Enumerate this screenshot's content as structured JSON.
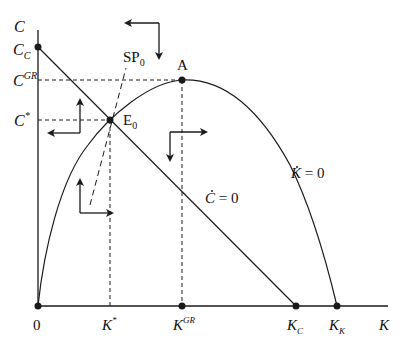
{
  "diagram": {
    "type": "phase-diagram",
    "colors": {
      "line": "#1a1a1a",
      "background": "#ffffff"
    },
    "axes": {
      "y_label": "C",
      "x_label": "K",
      "origin_label": "0"
    },
    "y_ticks": [
      {
        "id": "cc",
        "base": "C",
        "sub": "C",
        "sup": ""
      },
      {
        "id": "cgr",
        "base": "C",
        "sub": "",
        "sup": "GR"
      },
      {
        "id": "cstar",
        "base": "C",
        "sub": "",
        "sup": "*"
      }
    ],
    "x_ticks": [
      {
        "id": "kstar",
        "base": "K",
        "sub": "",
        "sup": "*"
      },
      {
        "id": "kgr",
        "base": "K",
        "sub": "",
        "sup": "GR"
      },
      {
        "id": "kc",
        "base": "K",
        "sub": "C",
        "sup": ""
      },
      {
        "id": "kk",
        "base": "K",
        "sub": "K",
        "sup": ""
      }
    ],
    "points": {
      "A": "A",
      "E0_base": "E",
      "E0_sub": "0"
    },
    "curves": {
      "saddle_path_base": "SP",
      "saddle_path_sub": "0",
      "k_dot_zero_var": "K",
      "k_dot_zero_eq": " = 0",
      "c_dot_zero_var": "C",
      "c_dot_zero_eq": " = 0"
    }
  }
}
